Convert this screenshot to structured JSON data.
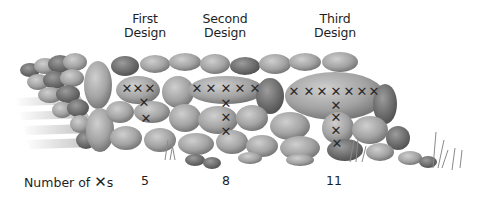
{
  "designs": [
    {
      "name_line1": "First",
      "name_line2": "Design",
      "count": "5",
      "label_x": 145,
      "count_x": 145,
      "marks": [
        [
          127,
          88
        ],
        [
          138,
          88
        ],
        [
          150,
          88
        ],
        [
          144,
          102
        ],
        [
          146,
          118
        ]
      ]
    },
    {
      "name_line1": "Second",
      "name_line2": "Design",
      "count": "8",
      "label_x": 225,
      "count_x": 226,
      "marks": [
        [
          197,
          88
        ],
        [
          211,
          88
        ],
        [
          226,
          88
        ],
        [
          240,
          88
        ],
        [
          255,
          88
        ],
        [
          226,
          103
        ],
        [
          226,
          117
        ],
        [
          226,
          131
        ]
      ]
    },
    {
      "name_line1": "Third",
      "name_line2": "Design",
      "count": "11",
      "label_x": 335,
      "count_x": 334,
      "marks": [
        [
          294,
          91
        ],
        [
          309,
          91
        ],
        [
          322,
          91
        ],
        [
          336,
          91
        ],
        [
          349,
          91
        ],
        [
          362,
          91
        ],
        [
          374,
          91
        ],
        [
          336,
          105
        ],
        [
          336,
          117
        ],
        [
          336,
          130
        ],
        [
          337,
          143
        ]
      ]
    }
  ],
  "count_row": {
    "label_prefix": "Number of ",
    "mark_symbol": "✕",
    "label_suffix": "s"
  },
  "mark_symbol": "✕",
  "colors": {
    "stone_light": "#b8b8b8",
    "stone_mid": "#9a9a9a",
    "stone_dark": "#6e6e6e",
    "mark": "#2a2a2a",
    "text": "#1e1e1e"
  }
}
